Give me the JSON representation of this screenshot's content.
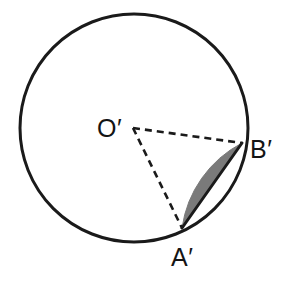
{
  "figure": {
    "type": "geometry-diagram",
    "background_color": "#ffffff",
    "stroke_color": "#1a1a1a",
    "segment_fill_color": "#7a7a7a",
    "labels": {
      "center": "O′",
      "point_a": "A′",
      "point_b": "B′"
    },
    "geometry": {
      "circle": {
        "center_x": 134,
        "center_y": 128,
        "radius": 114,
        "stroke_width": 3
      },
      "center_point": {
        "x": 133,
        "y": 128
      },
      "point_a": {
        "x": 182,
        "y": 228
      },
      "point_b": {
        "x": 242,
        "y": 143
      },
      "radius_oa_style": "dashed",
      "radius_ob_style": "dashed",
      "chord_ab_style": "solid",
      "dash_pattern": "7 5",
      "dash_width": 2.6,
      "chord_width": 3
    },
    "label_positions": {
      "center": {
        "x": 97,
        "y": 137
      },
      "point_a": {
        "x": 171,
        "y": 266
      },
      "point_b": {
        "x": 250,
        "y": 158
      }
    }
  }
}
